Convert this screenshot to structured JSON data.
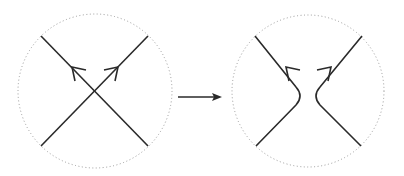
{
  "diagram": {
    "stroke_color": "#2a2a2a",
    "circle_color": "#9a9a9a",
    "left_panel": {
      "label": "crossing",
      "circle": {
        "cx": 95,
        "cy": 91,
        "r": 77
      }
    },
    "transition_arrow": {
      "label": "arrow-right",
      "x1": 178,
      "x2": 221,
      "y": 97
    },
    "right_panel": {
      "label": "smoothing",
      "circle": {
        "cx": 308,
        "cy": 91,
        "r": 76
      }
    }
  }
}
